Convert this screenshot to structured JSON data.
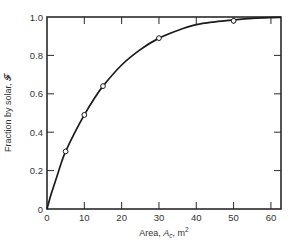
{
  "chart_data": {
    "type": "line",
    "title": "",
    "xlabel": "Area, A_c, m²",
    "xlabel_parts": {
      "prefix": "Area, ",
      "var": "A",
      "sub": "c",
      "suffix": ", m",
      "sup": "2"
    },
    "ylabel": "Fraction by solar, 𝓕",
    "xlim": [
      0,
      62.7
    ],
    "ylim": [
      0,
      1.0
    ],
    "x_ticks": [
      0,
      10,
      20,
      30,
      40,
      50,
      60
    ],
    "x_tick_labels": [
      "0",
      "10",
      "20",
      "30",
      "40",
      "50",
      "60"
    ],
    "y_ticks": [
      0,
      0.2,
      0.4,
      0.6,
      0.8,
      1.0
    ],
    "y_tick_labels": [
      "0",
      "0.2",
      "0.4",
      "0.6",
      "0.8",
      "1.0"
    ],
    "grid": false,
    "legend": null,
    "series": [
      {
        "name": "Fraction by solar",
        "markers": "open-circle",
        "points": [
          {
            "x": 5,
            "y": 0.3
          },
          {
            "x": 10,
            "y": 0.49
          },
          {
            "x": 15,
            "y": 0.64
          },
          {
            "x": 30,
            "y": 0.89
          },
          {
            "x": 50,
            "y": 0.98
          }
        ],
        "curve": [
          {
            "x": 0,
            "y": 0
          },
          {
            "x": 1,
            "y": 0.07
          },
          {
            "x": 2,
            "y": 0.13
          },
          {
            "x": 3,
            "y": 0.19
          },
          {
            "x": 4,
            "y": 0.25
          },
          {
            "x": 5,
            "y": 0.3
          },
          {
            "x": 7.5,
            "y": 0.4
          },
          {
            "x": 10,
            "y": 0.49
          },
          {
            "x": 12.5,
            "y": 0.57
          },
          {
            "x": 15,
            "y": 0.64
          },
          {
            "x": 20,
            "y": 0.75
          },
          {
            "x": 25,
            "y": 0.83
          },
          {
            "x": 30,
            "y": 0.89
          },
          {
            "x": 35,
            "y": 0.93
          },
          {
            "x": 40,
            "y": 0.96
          },
          {
            "x": 45,
            "y": 0.975
          },
          {
            "x": 50,
            "y": 0.985
          },
          {
            "x": 55,
            "y": 0.993
          },
          {
            "x": 60,
            "y": 0.997
          },
          {
            "x": 62.7,
            "y": 0.998
          }
        ]
      }
    ]
  },
  "style": {
    "line_color": "#1a1a1a",
    "axis_color": "#2a2a2a",
    "marker_fill": "#ffffff"
  }
}
